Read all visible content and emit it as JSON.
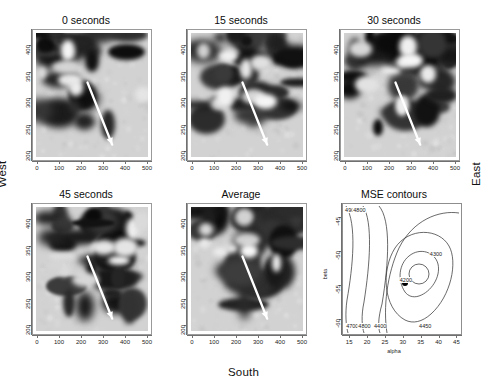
{
  "figure": {
    "orientation_labels": {
      "west": "West",
      "east": "East",
      "south": "South"
    }
  },
  "image_panels": [
    {
      "id": "panel-0-seconds",
      "title": "0 seconds",
      "xticks": [
        "0",
        "100",
        "200",
        "300",
        "400",
        "500"
      ],
      "yticks": [
        "200",
        "250",
        "300",
        "350",
        "400"
      ],
      "arrow": "white-arrow-southeast"
    },
    {
      "id": "panel-15-seconds",
      "title": "15 seconds",
      "xticks": [
        "0",
        "100",
        "200",
        "300",
        "400",
        "500"
      ],
      "yticks": [
        "200",
        "250",
        "300",
        "350",
        "400"
      ],
      "arrow": "white-arrow-southeast"
    },
    {
      "id": "panel-30-seconds",
      "title": "30 seconds",
      "xticks": [
        "0",
        "100",
        "200",
        "300",
        "400",
        "500"
      ],
      "yticks": [
        "200",
        "250",
        "300",
        "350",
        "400"
      ],
      "arrow": "white-arrow-southeast"
    },
    {
      "id": "panel-45-seconds",
      "title": "45 seconds",
      "xticks": [
        "0",
        "100",
        "200",
        "300",
        "400",
        "500"
      ],
      "yticks": [
        "200",
        "250",
        "300",
        "350",
        "400"
      ],
      "arrow": "white-arrow-southeast"
    },
    {
      "id": "panel-average",
      "title": "Average",
      "xticks": [
        "0",
        "100",
        "200",
        "300",
        "400",
        "500"
      ],
      "yticks": [
        "200",
        "250",
        "300",
        "350",
        "400"
      ],
      "arrow": "white-arrow-southeast"
    }
  ],
  "chart_data": {
    "type": "contour",
    "title": "MSE contours",
    "xlabel": "alpha",
    "ylabel": "beta",
    "xlim": [
      13,
      46
    ],
    "ylim": [
      -62,
      -43
    ],
    "xticks": [
      15,
      20,
      25,
      30,
      35,
      40,
      45
    ],
    "yticks": [
      -45,
      -50,
      -55,
      -60
    ],
    "contour_levels": [
      4200,
      4300,
      4400,
      4450,
      4800,
      4900
    ],
    "contour_labels": [
      {
        "text": "4900",
        "x": 15.3,
        "y": -43.9
      },
      {
        "text": "4800",
        "x": 17.6,
        "y": -43.9
      },
      {
        "text": "4300",
        "x": 39.0,
        "y": -50.3
      },
      {
        "text": "4200",
        "x": 30.6,
        "y": -54.1
      },
      {
        "text": "4700",
        "x": 15.6,
        "y": -60.9
      },
      {
        "text": "4800",
        "x": 19.0,
        "y": -60.9
      },
      {
        "text": "4400",
        "x": 23.4,
        "y": -60.9
      },
      {
        "text": "4450",
        "x": 36.0,
        "y": -60.9
      }
    ],
    "minimum_point": {
      "alpha": 30.2,
      "beta": -54.6,
      "marker": "filled-circle"
    }
  }
}
